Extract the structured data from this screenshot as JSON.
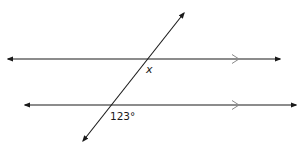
{
  "diagram": {
    "type": "parallel-lines-transversal",
    "lines": [
      {
        "name": "top-parallel-line",
        "x1": 8,
        "y1": 59,
        "x2": 280,
        "y2": 59,
        "parallel_mark_x": 237
      },
      {
        "name": "bottom-parallel-line",
        "x1": 25,
        "y1": 105,
        "x2": 296,
        "y2": 105,
        "parallel_mark_x": 237
      }
    ],
    "transversal": {
      "x1": 184,
      "y1": 13,
      "x2": 83,
      "y2": 141
    },
    "labels": {
      "unknown_angle": "x",
      "known_angle": "123°"
    },
    "colors": {
      "line": "#1a1a1a",
      "parallel_mark": "#8a8a8a"
    }
  }
}
